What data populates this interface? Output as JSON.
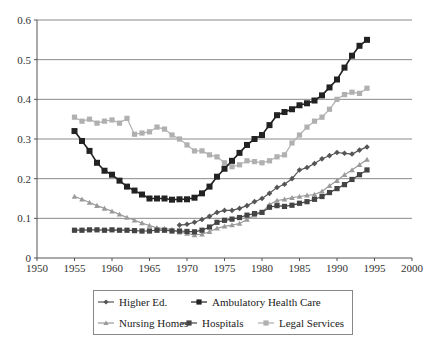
{
  "chart_data": {
    "type": "line",
    "title": "",
    "xlabel": "",
    "ylabel": "",
    "xlim": [
      1950,
      2000
    ],
    "ylim": [
      0,
      0.6
    ],
    "grid": "horizontal",
    "legend_position": "bottom",
    "x_ticks": [
      "1950",
      "1955",
      "1960",
      "1965",
      "1970",
      "1975",
      "1980",
      "1985",
      "1990",
      "1995",
      "2000"
    ],
    "y_ticks": [
      "0",
      "0.1",
      "0.2",
      "0.3",
      "0.4",
      "0.5",
      "0.6"
    ],
    "series": [
      {
        "name": "Higher Ed.",
        "marker": "diamond",
        "color": "#555555",
        "x": [
          1969,
          1970,
          1971,
          1972,
          1973,
          1974,
          1975,
          1976,
          1977,
          1978,
          1979,
          1980,
          1981,
          1982,
          1983,
          1984,
          1985,
          1986,
          1987,
          1988,
          1989,
          1990,
          1991,
          1992,
          1993,
          1994
        ],
        "values": [
          0.083,
          0.085,
          0.09,
          0.097,
          0.105,
          0.115,
          0.12,
          0.12,
          0.125,
          0.132,
          0.142,
          0.15,
          0.163,
          0.178,
          0.186,
          0.2,
          0.222,
          0.228,
          0.238,
          0.25,
          0.258,
          0.266,
          0.264,
          0.262,
          0.272,
          0.28
        ]
      },
      {
        "name": "Ambulatory Health Care",
        "marker": "square",
        "color": "#222222",
        "x": [
          1955,
          1956,
          1957,
          1958,
          1959,
          1960,
          1961,
          1962,
          1963,
          1964,
          1965,
          1966,
          1967,
          1968,
          1969,
          1970,
          1971,
          1972,
          1973,
          1974,
          1975,
          1976,
          1977,
          1978,
          1979,
          1980,
          1981,
          1982,
          1983,
          1984,
          1985,
          1986,
          1987,
          1988,
          1989,
          1990,
          1991,
          1992,
          1993,
          1994
        ],
        "values": [
          0.32,
          0.295,
          0.27,
          0.24,
          0.22,
          0.21,
          0.195,
          0.18,
          0.17,
          0.16,
          0.15,
          0.15,
          0.15,
          0.147,
          0.148,
          0.148,
          0.152,
          0.163,
          0.18,
          0.205,
          0.225,
          0.245,
          0.265,
          0.285,
          0.3,
          0.31,
          0.335,
          0.36,
          0.368,
          0.375,
          0.385,
          0.39,
          0.397,
          0.41,
          0.43,
          0.45,
          0.48,
          0.51,
          0.535,
          0.55
        ]
      },
      {
        "name": "Nursing Homes",
        "marker": "triangle",
        "color": "#9a9a9a",
        "x": [
          1955,
          1956,
          1957,
          1958,
          1959,
          1960,
          1961,
          1962,
          1963,
          1964,
          1965,
          1966,
          1967,
          1968,
          1969,
          1970,
          1971,
          1972,
          1973,
          1974,
          1975,
          1976,
          1977,
          1978,
          1979,
          1980,
          1981,
          1982,
          1983,
          1984,
          1985,
          1986,
          1987,
          1988,
          1989,
          1990,
          1991,
          1992,
          1993,
          1994
        ],
        "values": [
          0.155,
          0.148,
          0.14,
          0.132,
          0.125,
          0.118,
          0.11,
          0.102,
          0.095,
          0.088,
          0.082,
          0.076,
          0.074,
          0.072,
          0.065,
          0.062,
          0.058,
          0.06,
          0.066,
          0.075,
          0.08,
          0.083,
          0.087,
          0.097,
          0.108,
          0.115,
          0.135,
          0.145,
          0.148,
          0.152,
          0.155,
          0.158,
          0.16,
          0.168,
          0.182,
          0.195,
          0.21,
          0.222,
          0.235,
          0.248
        ]
      },
      {
        "name": "Hospitals",
        "marker": "square",
        "color": "#444444",
        "x": [
          1955,
          1956,
          1957,
          1958,
          1959,
          1960,
          1961,
          1962,
          1963,
          1964,
          1965,
          1966,
          1967,
          1968,
          1969,
          1970,
          1971,
          1972,
          1973,
          1974,
          1975,
          1976,
          1977,
          1978,
          1979,
          1980,
          1981,
          1982,
          1983,
          1984,
          1985,
          1986,
          1987,
          1988,
          1989,
          1990,
          1991,
          1992,
          1993,
          1994
        ],
        "values": [
          0.07,
          0.07,
          0.071,
          0.071,
          0.07,
          0.071,
          0.07,
          0.07,
          0.069,
          0.068,
          0.068,
          0.07,
          0.07,
          0.068,
          0.068,
          0.067,
          0.066,
          0.07,
          0.078,
          0.09,
          0.095,
          0.098,
          0.102,
          0.108,
          0.112,
          0.115,
          0.128,
          0.132,
          0.13,
          0.133,
          0.138,
          0.142,
          0.148,
          0.155,
          0.165,
          0.175,
          0.185,
          0.198,
          0.21,
          0.222
        ]
      },
      {
        "name": "Legal Services",
        "marker": "square",
        "color": "#b0b0b0",
        "x": [
          1955,
          1956,
          1957,
          1958,
          1959,
          1960,
          1961,
          1962,
          1963,
          1964,
          1965,
          1966,
          1967,
          1968,
          1969,
          1970,
          1971,
          1972,
          1973,
          1974,
          1975,
          1976,
          1977,
          1978,
          1979,
          1980,
          1981,
          1982,
          1983,
          1984,
          1985,
          1986,
          1987,
          1988,
          1989,
          1990,
          1991,
          1992,
          1993,
          1994
        ],
        "values": [
          0.355,
          0.345,
          0.35,
          0.34,
          0.345,
          0.348,
          0.34,
          0.352,
          0.312,
          0.315,
          0.318,
          0.33,
          0.325,
          0.31,
          0.3,
          0.285,
          0.27,
          0.27,
          0.26,
          0.255,
          0.24,
          0.23,
          0.235,
          0.245,
          0.243,
          0.24,
          0.245,
          0.255,
          0.26,
          0.29,
          0.31,
          0.33,
          0.345,
          0.355,
          0.375,
          0.4,
          0.412,
          0.418,
          0.415,
          0.428
        ]
      }
    ]
  },
  "legend": {
    "rows": [
      [
        "Higher Ed.",
        "Ambulatory Health Care"
      ],
      [
        "Nursing Homes",
        "Hospitals",
        "Legal Services"
      ]
    ]
  },
  "colors": {
    "gridline": "#8a8a8a",
    "axis": "#555555",
    "legend_border": "#888888"
  }
}
